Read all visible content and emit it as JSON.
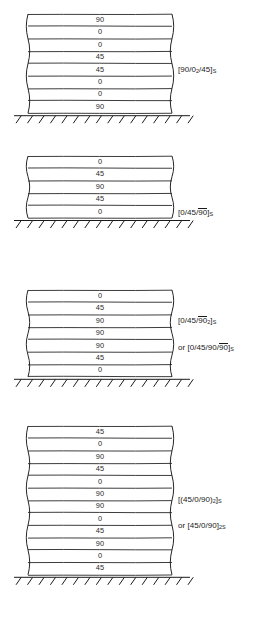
{
  "figure": {
    "ink_color": "#1a1a1a",
    "ply_text_color": "#2a2a2a",
    "background": "#ffffff"
  },
  "laminates": [
    {
      "id": "laminate-1",
      "ply_count": 8,
      "plies": [
        "90",
        "0",
        "0",
        "45",
        "45",
        "0",
        "0",
        "90"
      ],
      "notations": [
        {
          "id": "notation-1a",
          "prefix": "",
          "text": "[90/0₂/45]ₛ",
          "parts": [
            {
              "t": "[90/0",
              "bar": false,
              "sub": false
            },
            {
              "t": "2",
              "bar": false,
              "sub": true
            },
            {
              "t": "/45]",
              "bar": false,
              "sub": false
            },
            {
              "t": "S",
              "bar": false,
              "sub": true
            }
          ]
        }
      ]
    },
    {
      "id": "laminate-2",
      "ply_count": 5,
      "plies": [
        "0",
        "45",
        "90",
        "45",
        "0"
      ],
      "notations": [
        {
          "id": "notation-2a",
          "prefix": "",
          "text": "[0/45/90̅]ₛ",
          "parts": [
            {
              "t": "[0/45/",
              "bar": false,
              "sub": false
            },
            {
              "t": "90",
              "bar": true,
              "sub": false
            },
            {
              "t": "]",
              "bar": false,
              "sub": false
            },
            {
              "t": "S",
              "bar": false,
              "sub": true
            }
          ]
        }
      ]
    },
    {
      "id": "laminate-3",
      "ply_count": 7,
      "plies": [
        "0",
        "45",
        "90",
        "90",
        "90",
        "45",
        "0"
      ],
      "notations": [
        {
          "id": "notation-3a",
          "prefix": "",
          "text": "[0/45/90̅₂]ₛ",
          "parts": [
            {
              "t": "[0/45/",
              "bar": false,
              "sub": false
            },
            {
              "t": "90",
              "bar": true,
              "sub": false
            },
            {
              "t": "2",
              "bar": false,
              "sub": true
            },
            {
              "t": "]",
              "bar": false,
              "sub": false
            },
            {
              "t": "S",
              "bar": false,
              "sub": true
            }
          ]
        },
        {
          "id": "notation-3b",
          "prefix": "or ",
          "text": "or [0/45/90/90̅]ₛ",
          "parts": [
            {
              "t": "or [0/45/90/",
              "bar": false,
              "sub": false
            },
            {
              "t": "90",
              "bar": true,
              "sub": false
            },
            {
              "t": "]",
              "bar": false,
              "sub": false
            },
            {
              "t": "S",
              "bar": false,
              "sub": true
            }
          ]
        }
      ]
    },
    {
      "id": "laminate-4",
      "ply_count": 12,
      "plies": [
        "45",
        "0",
        "90",
        "45",
        "0",
        "90",
        "90",
        "0",
        "45",
        "90",
        "0",
        "45"
      ],
      "notations": [
        {
          "id": "notation-4a",
          "prefix": "",
          "text": "[(45/0/90)₂]ₛ",
          "parts": [
            {
              "t": "[(45/0/90)",
              "bar": false,
              "sub": false
            },
            {
              "t": "2",
              "bar": false,
              "sub": true
            },
            {
              "t": "]",
              "bar": false,
              "sub": false
            },
            {
              "t": "S",
              "bar": false,
              "sub": true
            }
          ]
        },
        {
          "id": "notation-4b",
          "prefix": "or ",
          "text": "or [45/0/90]₂ₛ",
          "parts": [
            {
              "t": "or [45/0/90]",
              "bar": false,
              "sub": false
            },
            {
              "t": "2S",
              "bar": false,
              "sub": true
            }
          ]
        }
      ]
    }
  ],
  "ground": {
    "label": "fixed-support-hatching",
    "hatch_count": 16
  }
}
